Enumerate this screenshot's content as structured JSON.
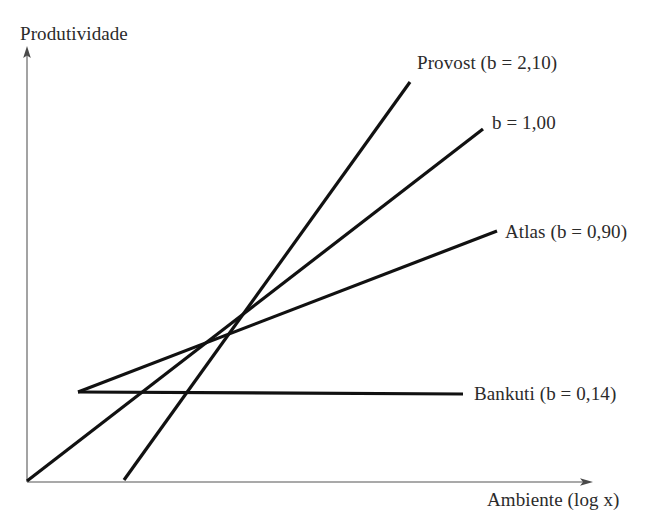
{
  "chart_data": {
    "type": "line",
    "title": "",
    "xlabel": "Ambiente (log x)",
    "ylabel": "Produtividade",
    "grid": false,
    "legend_position": "line-end-labels",
    "axes": {
      "x_arrow": true,
      "y_arrow": true,
      "x_tick_labels": [],
      "y_tick_labels": [],
      "xlim": [
        0,
        1
      ],
      "ylim": [
        0,
        1
      ]
    },
    "annotations": [
      "Produtividade",
      "Ambiente (log x)",
      "Provost (b = 2,10)",
      "b = 1,00",
      "Atlas (b = 0,90)",
      "Bankuti (b = 0,14)"
    ],
    "series": [
      {
        "name": "Provost",
        "label": "Provost (b = 2,10)",
        "b": "2,10",
        "b_value": 2.1,
        "color": "#111111",
        "x": [
          124,
          410
        ],
        "y": [
          480,
          82
        ]
      },
      {
        "name": "b = 1,00",
        "label": "b = 1,00",
        "b": "1,00",
        "b_value": 1.0,
        "color": "#111111",
        "x": [
          27,
          483
        ],
        "y": [
          481,
          129
        ]
      },
      {
        "name": "Atlas",
        "label": "Atlas (b = 0,90)",
        "b": "0,90",
        "b_value": 0.9,
        "color": "#111111",
        "x": [
          78,
          497
        ],
        "y": [
          392,
          231
        ]
      },
      {
        "name": "Bankuti",
        "label": "Bankuti (b = 0,14)",
        "b": "0,14",
        "b_value": 0.14,
        "color": "#111111",
        "x": [
          78,
          463
        ],
        "y": [
          392,
          394
        ]
      }
    ]
  },
  "figure": {
    "background": "#ffffff",
    "axis_color": "#8c8c8c",
    "line_color": "#111111",
    "text_color": "#2b2b2b",
    "y_axis_label": "Produtividade",
    "x_axis_label": "Ambiente (log x)"
  },
  "labels": {
    "provost": "Provost (b = 2,10)",
    "b100": "b = 1,00",
    "atlas": "Atlas (b = 0,90)",
    "bankuti": "Bankuti (b = 0,14)"
  }
}
